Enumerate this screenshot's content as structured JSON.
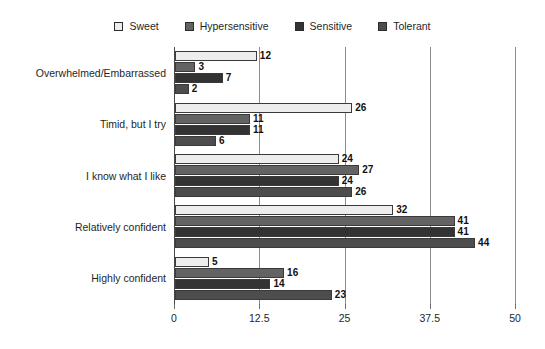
{
  "chart_data": {
    "type": "bar",
    "orientation": "horizontal",
    "title": "",
    "xlabel": "",
    "ylabel": "",
    "xlim": [
      0,
      50
    ],
    "xticks": [
      "0",
      "12.5",
      "25",
      "37.5",
      "50"
    ],
    "xtick_values": [
      0,
      12.5,
      25,
      37.5,
      50
    ],
    "grid": true,
    "grid_axis": "x",
    "legend_position": "top-center",
    "show_value_labels": true,
    "categories": [
      "Overwhelmed/Embarrassed",
      "Timid, but I try",
      "I know what I like",
      "Relatively confident",
      "Highly confident"
    ],
    "series": [
      {
        "name": "Sweet",
        "color": "#ededed",
        "values": [
          12,
          26,
          24,
          32,
          5
        ]
      },
      {
        "name": "Hypersensitive",
        "color": "#636363",
        "values": [
          3,
          11,
          27,
          41,
          16
        ]
      },
      {
        "name": "Sensitive",
        "color": "#333333",
        "values": [
          7,
          11,
          24,
          41,
          14
        ]
      },
      {
        "name": "Tolerant",
        "color": "#4d4d4d",
        "values": [
          2,
          6,
          26,
          44,
          23
        ]
      }
    ]
  }
}
